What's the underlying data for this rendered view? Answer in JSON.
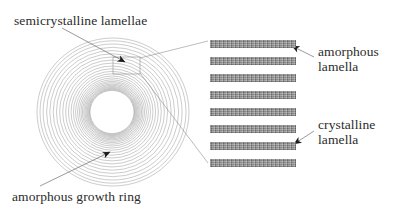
{
  "figure": {
    "type": "schematic-diagram",
    "background_color": "#ffffff",
    "line_color": "#9a9a9a",
    "text_color": "#2b2b2b",
    "lamella_color": "#8d8d8d"
  },
  "labels": {
    "semicrystalline": "semicrystalline lamellae",
    "amorphous_growth_ring": "amorphous growth ring",
    "amorphous_lamella_line1": "amorphous",
    "amorphous_lamella_line2": "lamella",
    "crystalline_lamella_line1": "crystalline",
    "crystalline_lamella_line2": "lamella"
  },
  "rings": {
    "center_x": 113,
    "center_y": 112,
    "count": 26,
    "outer_radius_x": 76,
    "outer_radius_y": 74,
    "inner_radius_x": 22,
    "inner_radius_y": 21
  },
  "callout_box": {
    "x": 113,
    "y": 57,
    "width": 27,
    "height": 17
  },
  "lamellae_stack": {
    "x": 210,
    "y": 38,
    "bar_width": 86,
    "bar_height": 8,
    "pitch": 17,
    "count": 8,
    "bars": [
      {
        "index": 0,
        "top": 2
      },
      {
        "index": 1,
        "top": 19
      },
      {
        "index": 2,
        "top": 36
      },
      {
        "index": 3,
        "top": 53
      },
      {
        "index": 4,
        "top": 70
      },
      {
        "index": 5,
        "top": 87
      },
      {
        "index": 6,
        "top": 104
      },
      {
        "index": 7,
        "top": 121
      }
    ]
  },
  "leader_lines": {
    "semicrystalline_arrow_target": [
      125,
      62
    ],
    "amorphous_ring_arrow_target": [
      110,
      152
    ],
    "amorphous_lamella_arrow_target": [
      292,
      46
    ],
    "crystalline_lamella_arrow_target": [
      294,
      144
    ]
  }
}
